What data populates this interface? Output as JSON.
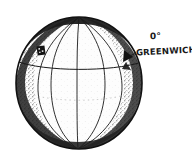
{
  "figure": {
    "style": "hand-drawn pen-and-ink engraving",
    "background_color": "#ffffff",
    "ink_color": "#1a1a1a"
  },
  "labels": {
    "zero_degrees": "0°",
    "greenwich": "GREENWICH"
  },
  "globe": {
    "center_x": 79,
    "center_y": 83,
    "radius_x": 63,
    "radius_y": 66,
    "outline_color": "#141414",
    "shading_color": "#2a2a2a",
    "fill_color": "#fdfdfd",
    "north_pole": {
      "x": 79,
      "y": 17
    },
    "south_pole": {
      "x": 78,
      "y": 149
    },
    "meridian_offsets": [
      -41,
      -27,
      0,
      26,
      43
    ],
    "equator": {
      "left_x": 16,
      "left_y": 61,
      "mid_y": 71,
      "right_x": 142,
      "right_y": 62
    }
  },
  "markers": {
    "location_marker": {
      "x": 41,
      "y": 51,
      "label": "location-marker"
    },
    "greenwich_marker": {
      "x": 128,
      "y": 56,
      "label": "greenwich-marker"
    }
  }
}
